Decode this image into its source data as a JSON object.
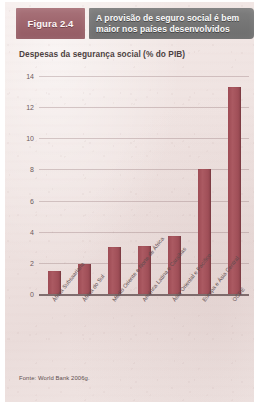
{
  "figure": {
    "badge_label": "Figura 2.4",
    "title_line1": "A provisão de seguro social é bem",
    "title_line2": "maior nos países desenvolvidos",
    "badge_color": "#9d646c",
    "title_bar_color": "#757575",
    "source": "Fonte: World Bank 2006g."
  },
  "chart_data": {
    "type": "bar",
    "title": "Despesas da segurança social (% do PIB)",
    "xlabel": "",
    "ylabel": "",
    "ylim": [
      0,
      14
    ],
    "yticks": [
      0,
      2,
      4,
      6,
      8,
      10,
      12,
      14
    ],
    "ytick_labels": [
      "0",
      "2",
      "4",
      "6",
      "8",
      "10",
      "12",
      "14"
    ],
    "grid": true,
    "legend": "none",
    "bar_color": "#a5515a",
    "categories": [
      "África Subsaariana",
      "África do Sul",
      "Médio Oriente e Norte de África",
      "América Latina e Caraíbas",
      "Ásia Oriental e Pacífico",
      "Europa e Ásia Central",
      "OCDE"
    ],
    "values": [
      1.5,
      1.9,
      3.0,
      3.1,
      3.7,
      8.0,
      13.3
    ]
  }
}
